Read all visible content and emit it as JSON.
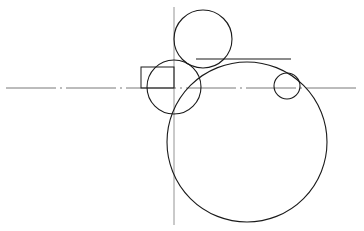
{
  "diagram": {
    "width": 364,
    "height": 231,
    "colors": {
      "background": "#ffffff",
      "outline": "#1a1a1a",
      "centerline": "#555555",
      "construction": "#888888"
    },
    "centerline_horizontal": {
      "x1": 6,
      "y1": 88,
      "x2": 358,
      "y2": 88,
      "style": "dash-dot"
    },
    "centerline_vertical": {
      "x1": 174,
      "y1": 7,
      "x2": 174,
      "y2": 225
    },
    "rectangle": {
      "x": 141,
      "y": 67,
      "width": 33,
      "height": 21
    },
    "tangent_line": {
      "x1": 196,
      "y1": 59,
      "x2": 291,
      "y2": 59
    },
    "circles": [
      {
        "name": "top-circle",
        "cx": 203,
        "cy": 39,
        "r": 29
      },
      {
        "name": "left-circle",
        "cx": 174,
        "cy": 87,
        "r": 27
      },
      {
        "name": "small-right-circle",
        "cx": 287,
        "cy": 86,
        "r": 13
      },
      {
        "name": "large-circle",
        "cx": 247,
        "cy": 142,
        "r": 80
      }
    ]
  }
}
